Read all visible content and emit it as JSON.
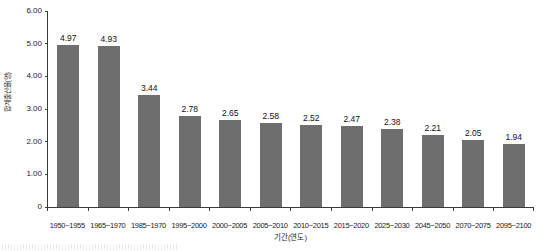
{
  "chart_data": {
    "type": "bar",
    "title": "",
    "xlabel": "기간(연도)",
    "ylabel": "합계출산율(명)",
    "categories": [
      "1950~1955",
      "1965~1970",
      "1985~1970",
      "1995~2000",
      "2000~2005",
      "2005~2010",
      "2010~2015",
      "2015~2020",
      "2025~2030",
      "2045~2050",
      "2070~2075",
      "2095~2100"
    ],
    "values": [
      4.97,
      4.93,
      3.44,
      2.78,
      2.65,
      2.58,
      2.52,
      2.47,
      2.38,
      2.21,
      2.05,
      1.94
    ],
    "value_labels": [
      "4.97",
      "4.93",
      "3.44",
      "2.78",
      "2.65",
      "2.58",
      "2.52",
      "2.47",
      "2.38",
      "2.21",
      "2.05",
      "1.94"
    ],
    "ylim": [
      0.0,
      6.0
    ],
    "y_ticks": [
      6.0,
      5.0,
      4.0,
      3.0,
      2.0,
      1.0,
      0.0
    ],
    "y_tick_labels": [
      "6.00",
      "5.00",
      "4.00",
      "3.00",
      "2.00",
      "1.00",
      "0"
    ],
    "grid": false,
    "legend": false,
    "legend_position": "none",
    "bar_color": "#6e6e6e",
    "axis_color": "#3a3a3a",
    "text_color": "#1a1a1a"
  }
}
